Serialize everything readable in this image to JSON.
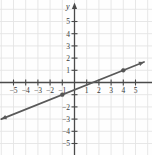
{
  "chart_data": {
    "type": "line",
    "title": "",
    "xlabel": "",
    "ylabel": "y",
    "xlim": [
      -6.2,
      5.9
    ],
    "ylim": [
      -5.7,
      6.2
    ],
    "grid": true,
    "legend": null,
    "x_ticks": [
      -5,
      -4,
      -3,
      -2,
      -1,
      1,
      2,
      3,
      4,
      5
    ],
    "y_ticks": [
      -5,
      -4,
      -3,
      -2,
      -1,
      1,
      2,
      3,
      4,
      5
    ],
    "x_tick_labels": [
      "-5",
      "-4",
      "-3",
      "-2",
      "-1",
      "1",
      "2",
      "3",
      "4",
      "5"
    ],
    "y_tick_labels": [
      "-5",
      "-4",
      "-3",
      "-2",
      "-1",
      "1",
      "2",
      "3",
      "4",
      "5"
    ],
    "hidden_y_tick_labels": [
      "-1"
    ],
    "series": [
      {
        "name": "line",
        "type": "line",
        "slope": 0.4,
        "intercept": -0.6,
        "x_range": [
          -6.0,
          5.7
        ],
        "arrow_start": true,
        "arrow_end": true,
        "color": "#595959",
        "points": [
          {
            "x": -1,
            "y": -1
          },
          {
            "x": 4,
            "y": 1
          }
        ]
      }
    ]
  },
  "axes": {
    "y_axis_label": "y",
    "origin_label": ""
  },
  "colors": {
    "grid": "#e4e4e4",
    "axis": "#4a4a4a",
    "line": "#595959",
    "point": "#555555",
    "background": "#fefefe",
    "tick_text": "#3a3a3a"
  }
}
